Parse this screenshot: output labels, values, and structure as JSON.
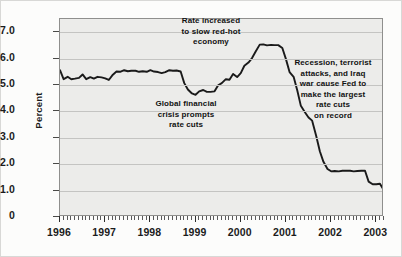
{
  "chart_data": {
    "type": "line",
    "title": "",
    "xlabel": "",
    "ylabel": "Percent",
    "xlim": [
      1996.0,
      2003.17
    ],
    "ylim": [
      0,
      7.5
    ],
    "yticks": [
      "0",
      "1.0",
      "2.0",
      "3.0",
      "4.0",
      "5.0",
      "6.0",
      "7.0"
    ],
    "ytick_values": [
      0,
      1,
      2,
      3,
      4,
      5,
      6,
      7
    ],
    "xticks": [
      "1996",
      "1997",
      "1998",
      "1999",
      "2000",
      "2001",
      "2002",
      "2003"
    ],
    "xtick_values": [
      1996,
      1997,
      1998,
      1999,
      2000,
      2001,
      2002,
      2003
    ],
    "grid": true,
    "legend": "none",
    "series": [
      {
        "name": "Federal funds rate",
        "color": "#1a1a1a",
        "x": [
          1996.0,
          1996.08,
          1996.17,
          1996.25,
          1996.33,
          1996.42,
          1996.5,
          1996.58,
          1996.67,
          1996.75,
          1996.83,
          1996.92,
          1997.0,
          1997.08,
          1997.17,
          1997.25,
          1997.33,
          1997.42,
          1997.5,
          1997.58,
          1997.67,
          1997.75,
          1997.83,
          1997.92,
          1998.0,
          1998.08,
          1998.17,
          1998.25,
          1998.33,
          1998.42,
          1998.5,
          1998.58,
          1998.67,
          1998.75,
          1998.83,
          1998.92,
          1999.0,
          1999.08,
          1999.17,
          1999.25,
          1999.33,
          1999.42,
          1999.5,
          1999.58,
          1999.67,
          1999.75,
          1999.83,
          1999.92,
          2000.0,
          2000.08,
          2000.17,
          2000.25,
          2000.33,
          2000.42,
          2000.5,
          2000.58,
          2000.67,
          2000.75,
          2000.83,
          2000.92,
          2001.0,
          2001.08,
          2001.17,
          2001.25,
          2001.33,
          2001.42,
          2001.5,
          2001.58,
          2001.67,
          2001.75,
          2001.83,
          2001.92,
          2002.0,
          2002.08,
          2002.17,
          2002.25,
          2002.33,
          2002.42,
          2002.5,
          2002.58,
          2002.67,
          2002.75,
          2002.83,
          2002.92,
          2003.0,
          2003.08,
          2003.17
        ],
        "values": [
          5.56,
          5.22,
          5.31,
          5.22,
          5.24,
          5.27,
          5.4,
          5.22,
          5.3,
          5.24,
          5.31,
          5.29,
          5.25,
          5.19,
          5.39,
          5.51,
          5.5,
          5.56,
          5.52,
          5.54,
          5.54,
          5.5,
          5.52,
          5.5,
          5.56,
          5.51,
          5.49,
          5.45,
          5.49,
          5.56,
          5.54,
          5.55,
          5.51,
          5.07,
          4.83,
          4.68,
          4.63,
          4.76,
          4.81,
          4.74,
          4.74,
          4.76,
          4.99,
          5.07,
          5.22,
          5.2,
          5.42,
          5.3,
          5.45,
          5.73,
          5.85,
          6.02,
          6.27,
          6.53,
          6.54,
          6.5,
          6.52,
          6.51,
          6.51,
          6.4,
          5.98,
          5.49,
          5.31,
          4.8,
          4.21,
          3.97,
          3.77,
          3.65,
          3.07,
          2.49,
          2.09,
          1.82,
          1.73,
          1.74,
          1.73,
          1.75,
          1.75,
          1.75,
          1.73,
          1.74,
          1.75,
          1.75,
          1.34,
          1.24,
          1.24,
          1.26,
          1.0
        ]
      }
    ],
    "annotations": [
      {
        "id": "ann-0",
        "text": "Rate increased\nto slow red-hot\neconomy"
      },
      {
        "id": "ann-1",
        "text": "Global financial\ncrisis prompts\nrate cuts"
      },
      {
        "id": "ann-2",
        "text": "Recession, terrorist\nattacks, and Iraq\nwar cause Fed to\nmake the largest\nrate cuts\non record"
      }
    ]
  }
}
